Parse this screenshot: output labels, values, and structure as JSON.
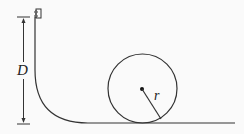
{
  "diagram": {
    "type": "physics-loop-track",
    "labels": {
      "height": "D",
      "radius": "r"
    },
    "colors": {
      "stroke": "#333333",
      "background": "#fafafa"
    }
  }
}
